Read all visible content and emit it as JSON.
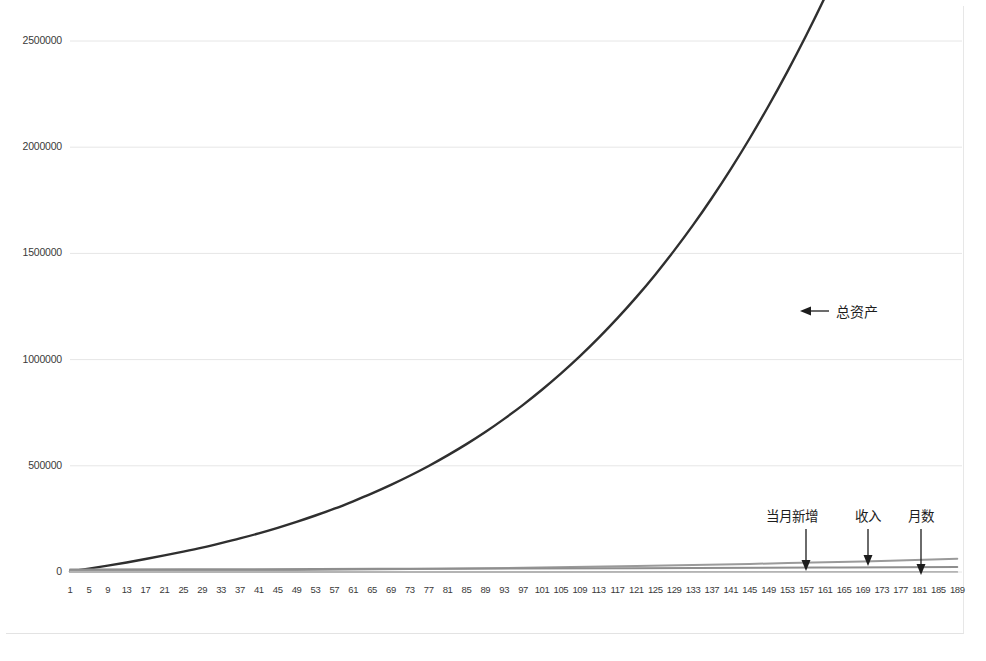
{
  "chart_data": {
    "type": "line",
    "title": "",
    "subtitle": "",
    "xlabel": "",
    "ylabel": "",
    "grid": true,
    "legend_position": "inline-annotations",
    "xlim": [
      1,
      190
    ],
    "ylim": [
      0,
      2500000
    ],
    "y_ticks": [
      0,
      500000,
      1000000,
      1500000,
      2000000,
      2500000
    ],
    "y_tick_labels": [
      "0",
      "500000",
      "1000000",
      "1500000",
      "2000000",
      "2500000"
    ],
    "x_tick_step": 4,
    "x_tick_labels": [
      "1",
      "5",
      "9",
      "13",
      "17",
      "21",
      "25",
      "29",
      "33",
      "37",
      "41",
      "45",
      "49",
      "53",
      "57",
      "61",
      "65",
      "69",
      "73",
      "77",
      "81",
      "85",
      "89",
      "93",
      "97",
      "101",
      "105",
      "109",
      "113",
      "117",
      "121",
      "125",
      "129",
      "133",
      "137",
      "141",
      "145",
      "149",
      "153",
      "157",
      "161",
      "165",
      "169",
      "173",
      "177",
      "181",
      "185",
      "189"
    ],
    "series": [
      {
        "name": "总资产",
        "color": "#2f2f2f",
        "width": 2.4,
        "annotation": {
          "label": "总资产",
          "arrow": "left",
          "label_x": 836,
          "label_y": 301,
          "arrow_tip_x": 800,
          "arrow_tip_y": 311,
          "arrow_tail_x": 829,
          "arrow_tail_y": 311
        },
        "points": [
          [
            1,
            3000
          ],
          [
            5,
            16000
          ],
          [
            9,
            30000
          ],
          [
            13,
            45000
          ],
          [
            17,
            61000
          ],
          [
            21,
            78000
          ],
          [
            25,
            96000
          ],
          [
            29,
            115000
          ],
          [
            33,
            136000
          ],
          [
            37,
            158000
          ],
          [
            41,
            182000
          ],
          [
            45,
            208000
          ],
          [
            49,
            236000
          ],
          [
            53,
            266000
          ],
          [
            57,
            298000
          ],
          [
            61,
            333000
          ],
          [
            65,
            370000
          ],
          [
            69,
            410000
          ],
          [
            73,
            453000
          ],
          [
            77,
            499000
          ],
          [
            81,
            549000
          ],
          [
            85,
            602000
          ],
          [
            89,
            659000
          ],
          [
            93,
            721000
          ],
          [
            97,
            787000
          ],
          [
            101,
            858000
          ],
          [
            105,
            934000
          ],
          [
            109,
            1015000
          ],
          [
            113,
            1102000
          ],
          [
            117,
            1195000
          ],
          [
            121,
            1294000
          ],
          [
            125,
            1400000
          ],
          [
            129,
            1513000
          ],
          [
            133,
            1633000
          ],
          [
            137,
            1761000
          ],
          [
            141,
            1897000
          ],
          [
            145,
            2041000
          ],
          [
            149,
            2194000
          ],
          [
            153,
            2356000
          ],
          [
            157,
            2527000
          ],
          [
            161,
            2708000
          ],
          [
            165,
            2899000
          ],
          [
            169,
            3101000
          ],
          [
            173,
            3314000
          ],
          [
            177,
            3539000
          ],
          [
            181,
            3776000
          ],
          [
            185,
            4026000
          ],
          [
            189,
            4290000
          ]
        ]
      },
      {
        "name": "当月新增",
        "color": "#9a9a9a",
        "width": 2.0,
        "annotation": {
          "label": "当月新增",
          "arrow": "down",
          "label_x": 766,
          "label_y": 505,
          "arrow_x": 806,
          "arrow_top_y": 529,
          "arrow_tip_y": 571
        },
        "points": [
          [
            1,
            5000
          ],
          [
            25,
            7000
          ],
          [
            49,
            10000
          ],
          [
            73,
            14000
          ],
          [
            97,
            20000
          ],
          [
            121,
            28000
          ],
          [
            145,
            38000
          ],
          [
            169,
            50000
          ],
          [
            189,
            62000
          ]
        ]
      },
      {
        "name": "收入",
        "color": "#8e8e8e",
        "width": 2.0,
        "annotation": {
          "label": "收入",
          "arrow": "down",
          "label_x": 855,
          "label_y": 505,
          "arrow_x": 868,
          "arrow_top_y": 529,
          "arrow_tip_y": 566
        },
        "points": [
          [
            1,
            12000
          ],
          [
            40,
            13500
          ],
          [
            80,
            15500
          ],
          [
            120,
            18000
          ],
          [
            160,
            21000
          ],
          [
            189,
            24000
          ]
        ]
      },
      {
        "name": "月数",
        "color": "#b4b4b4",
        "width": 1.8,
        "annotation": {
          "label": "月数",
          "arrow": "down",
          "label_x": 908,
          "label_y": 505,
          "arrow_x": 921,
          "arrow_top_y": 529,
          "arrow_tip_y": 575
        },
        "points": [
          [
            1,
            1
          ],
          [
            189,
            189
          ]
        ]
      }
    ]
  },
  "axis": {
    "y_labels": [
      "2500000",
      "2000000",
      "1500000",
      "1000000",
      "500000",
      "0"
    ],
    "x_labels": [
      "1",
      "5",
      "9",
      "13",
      "17",
      "21",
      "25",
      "29",
      "33",
      "37",
      "41",
      "45",
      "49",
      "53",
      "57",
      "61",
      "65",
      "69",
      "73",
      "77",
      "81",
      "85",
      "89",
      "93",
      "97",
      "101",
      "105",
      "109",
      "113",
      "117",
      "121",
      "125",
      "129",
      "133",
      "137",
      "141",
      "145",
      "149",
      "153",
      "157",
      "161",
      "165",
      "169",
      "173",
      "177",
      "181",
      "185",
      "189"
    ]
  },
  "annotations": {
    "total_assets": "总资产",
    "monthly_increase": "当月新增",
    "income": "收入",
    "month_count": "月数"
  },
  "colors": {
    "background": "#ffffff",
    "gridline": "#e6e6e6",
    "total_assets_line": "#2f2f2f",
    "secondary_line": "#9a9a9a",
    "tick_text": "#3a3a3a",
    "annotation_text": "#1d1d1d"
  }
}
